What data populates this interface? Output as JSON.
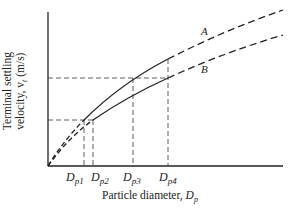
{
  "diagram": {
    "ylabel_line1": "Terminal settling",
    "ylabel_line2": "velocity, v",
    "ylabel_sub": "t",
    "ylabel_unit": " (m/s)",
    "xlabel_text": "Particle diameter, ",
    "xlabel_symbol": "D",
    "xlabel_sub": "p",
    "curves": [
      {
        "label": "A",
        "description": "upper curve"
      },
      {
        "label": "B",
        "description": "lower curve"
      }
    ],
    "ticks": [
      {
        "symbol": "D",
        "sub": "p1"
      },
      {
        "symbol": "D",
        "sub": "p2"
      },
      {
        "symbol": "D",
        "sub": "p3"
      },
      {
        "symbol": "D",
        "sub": "p4"
      }
    ]
  }
}
